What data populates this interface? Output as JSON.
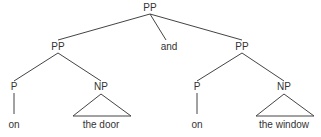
{
  "tree": {
    "root": {
      "label": "PP"
    },
    "left_pp": {
      "label": "PP"
    },
    "conj": {
      "label": "and"
    },
    "right_pp": {
      "label": "PP"
    },
    "left_p": {
      "label": "P"
    },
    "left_np": {
      "label": "NP"
    },
    "left_p_word": {
      "label": "on"
    },
    "left_np_words": {
      "label": "the door"
    },
    "right_p": {
      "label": "P"
    },
    "right_np": {
      "label": "NP"
    },
    "right_p_word": {
      "label": "on"
    },
    "right_np_words": {
      "label": "the window"
    }
  },
  "colors": {
    "line": "#444444",
    "text": "#333333",
    "background": "#ffffff"
  }
}
